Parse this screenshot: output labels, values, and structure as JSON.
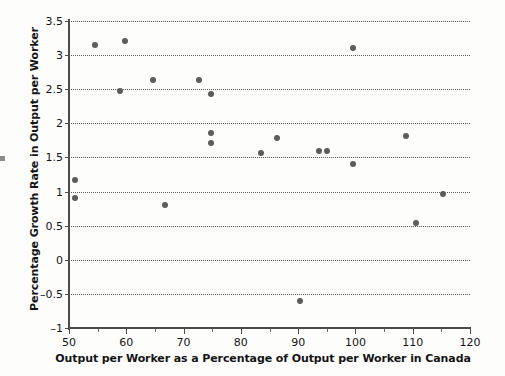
{
  "chart_data": {
    "type": "scatter",
    "title": "",
    "xlabel": "Output per Worker as a Percentage of Output per Worker in Canada",
    "ylabel": "Percentage Growth Rate in Output per Worker",
    "xlim": [
      50,
      120
    ],
    "ylim": [
      -1,
      3.5
    ],
    "xticks": [
      50,
      60,
      70,
      80,
      90,
      100,
      110,
      120
    ],
    "xtick_labels": [
      "50",
      "60",
      "70",
      "80",
      "90",
      "100",
      "110",
      "120"
    ],
    "yticks": [
      -1,
      -0.5,
      0,
      0.5,
      1,
      1.5,
      2,
      2.5,
      3,
      3.5
    ],
    "ytick_labels": [
      "–1",
      "–0.5",
      "0",
      "0.5",
      "1",
      "1.5",
      "2",
      "2.5",
      "3",
      "3.5"
    ],
    "grid": "horizontal-dotted",
    "legend": "none",
    "marker": "filled-circle",
    "marker_color": "#5c5c5c",
    "points": [
      {
        "x": 51.0,
        "y": 1.17
      },
      {
        "x": 51.0,
        "y": 0.9
      },
      {
        "x": 54.6,
        "y": 3.15
      },
      {
        "x": 58.9,
        "y": 2.47
      },
      {
        "x": 59.8,
        "y": 3.21
      },
      {
        "x": 64.7,
        "y": 2.64
      },
      {
        "x": 66.8,
        "y": 0.81
      },
      {
        "x": 72.7,
        "y": 2.64
      },
      {
        "x": 74.8,
        "y": 2.43
      },
      {
        "x": 74.8,
        "y": 1.86
      },
      {
        "x": 74.8,
        "y": 1.71
      },
      {
        "x": 83.5,
        "y": 1.57
      },
      {
        "x": 86.3,
        "y": 1.79
      },
      {
        "x": 90.3,
        "y": -0.61
      },
      {
        "x": 93.6,
        "y": 1.6
      },
      {
        "x": 95.0,
        "y": 1.59
      },
      {
        "x": 99.6,
        "y": 3.1
      },
      {
        "x": 99.6,
        "y": 1.41
      },
      {
        "x": 108.8,
        "y": 1.81
      },
      {
        "x": 110.6,
        "y": 0.54
      },
      {
        "x": 115.2,
        "y": 0.96
      }
    ]
  },
  "axis": {
    "x_title": "Output per Worker as a Percentage of Output per Worker in Canada",
    "y_title": "Percentage Growth Rate in Output per Worker"
  }
}
